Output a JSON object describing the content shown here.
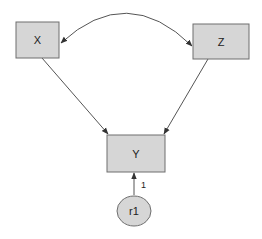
{
  "diagram": {
    "type": "path-diagram",
    "nodes": [
      {
        "id": "X",
        "label": "X",
        "shape": "rectangle"
      },
      {
        "id": "Z",
        "label": "Z",
        "shape": "rectangle"
      },
      {
        "id": "Y",
        "label": "Y",
        "shape": "rectangle"
      },
      {
        "id": "r1",
        "label": "r1",
        "shape": "ellipse"
      }
    ],
    "edges": [
      {
        "from": "X",
        "to": "Z",
        "type": "bidirectional-curved",
        "label": ""
      },
      {
        "from": "X",
        "to": "Y",
        "type": "directed",
        "label": ""
      },
      {
        "from": "Z",
        "to": "Y",
        "type": "directed",
        "label": ""
      },
      {
        "from": "r1",
        "to": "Y",
        "type": "directed",
        "label": "1"
      }
    ],
    "colors": {
      "node_fill": "#d6d6d6",
      "node_stroke": "#6e6e6e",
      "edge": "#555555"
    }
  }
}
